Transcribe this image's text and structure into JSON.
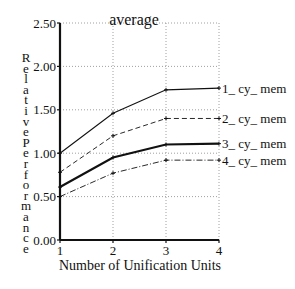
{
  "chart_data": {
    "type": "line",
    "title": "average",
    "xlabel": "Number of Unification Units",
    "ylabel": "Relative Performance",
    "x": [
      1,
      2,
      3,
      4
    ],
    "x_tick_labels": [
      "1",
      "2",
      "3",
      "4"
    ],
    "y_tick_labels": [
      "0.00",
      "0.50",
      "1.00",
      "1.50",
      "2.00",
      "2.50"
    ],
    "ylim": [
      0,
      2.5
    ],
    "xlim": [
      1,
      4
    ],
    "grid": true,
    "legend_position": "inline-right",
    "series": [
      {
        "name": "1_cy_mem",
        "style": "solid-thin",
        "values": [
          1.0,
          1.46,
          1.73,
          1.75
        ]
      },
      {
        "name": "2_cy_mem",
        "style": "dashed",
        "values": [
          0.78,
          1.2,
          1.4,
          1.4
        ]
      },
      {
        "name": "3_cy_mem",
        "style": "solid-thick",
        "values": [
          0.61,
          0.95,
          1.1,
          1.11
        ]
      },
      {
        "name": "4_cy_mem",
        "style": "dash-dot",
        "values": [
          0.5,
          0.77,
          0.92,
          0.92
        ]
      }
    ]
  },
  "labels": {
    "title": "average",
    "xlabel": "Number of Unification Units",
    "ylabel": "Relative Performance",
    "legend": [
      "1_ cy_ mem",
      "2_ cy_ mem",
      "3_ cy_ mem",
      "4_ cy_ mem"
    ]
  }
}
